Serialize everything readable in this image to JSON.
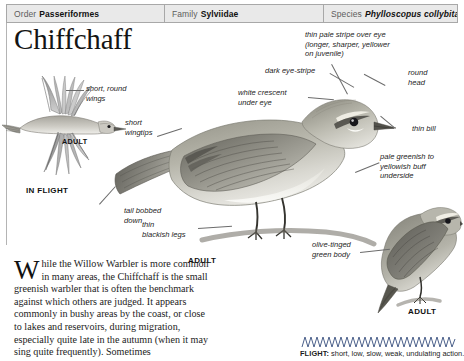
{
  "taxonomy": [
    {
      "rank": "Order",
      "value": "Passeriformes",
      "italic": false
    },
    {
      "rank": "Family",
      "value": "Sylviidae",
      "italic": false
    },
    {
      "rank": "Species",
      "value": "Phylloscopus collybita",
      "italic": true
    }
  ],
  "title": "Chiffchaff",
  "callouts": {
    "short_round_wings": "short, round\nwings",
    "short_wingtips": "short\nwingtips",
    "tail_bobbed_down": "tail bobbed\ndown",
    "thin_blackish_legs": "thin\nblackish legs",
    "thin_pale_stripe": "thin pale stripe over eye\n(longer, sharper, yellower\non juvenile)",
    "dark_eye_stripe": "dark eye-stripe",
    "white_crescent": "white crescent\nunder eye",
    "round_head": "round\nhead",
    "thin_bill": "thin bill",
    "pale_underside": "pale greenish to\nyellowish buff\nunderside",
    "olive_green_body": "olive-tinged\ngreen body"
  },
  "stage_labels": {
    "adult_flight": "ADULT",
    "in_flight": "IN FLIGHT",
    "adult_main": "ADULT",
    "adult_perched": "ADULT"
  },
  "body_text": {
    "dropcap": "W",
    "paragraph": "hile the Willow Warbler is more common in many areas, the Chiffchaff is the small greenish warbler that is often the benchmark against which others are judged. It appears commonly in bushy areas by the coast, or close to lakes and reservoirs, during migration, especially quite late in the autumn (when it may sing quite frequently). Sometimes"
  },
  "flight": {
    "label": "FLIGHT:",
    "description": " short, low, slow, weak, undulating action."
  },
  "colors": {
    "header_bg": "#e9e9e9",
    "header_border": "#a8a8a8",
    "text": "#1a1a1a",
    "leader_line": "#6b6b6b",
    "wave": "#4a5f8a"
  }
}
